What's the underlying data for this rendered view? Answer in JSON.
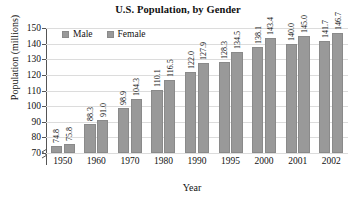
{
  "chart_data": {
    "type": "bar",
    "title": "U.S. Population, by Gender",
    "xlabel": "Year",
    "ylabel": "Population (millions)",
    "categories": [
      "1950",
      "1960",
      "1970",
      "1980",
      "1990",
      "1995",
      "2000",
      "2001",
      "2002"
    ],
    "series": [
      {
        "name": "Male",
        "color": "#999999",
        "values": [
          74.8,
          88.3,
          98.9,
          110.1,
          122.0,
          128.3,
          138.1,
          140.0,
          141.7
        ],
        "labels": [
          "74.8",
          "88.3",
          "98.9",
          "110.1",
          "122.0",
          "128.3",
          "138.1",
          "140.0",
          "141.7"
        ]
      },
      {
        "name": "Female",
        "color": "#999999",
        "values": [
          75.8,
          91.0,
          104.3,
          116.5,
          127.9,
          134.5,
          143.4,
          145.0,
          146.7
        ],
        "labels": [
          "75.8",
          "91.0",
          "104.3",
          "116.5",
          "127.9",
          "134.5",
          "143.4",
          "145.0",
          "146.7"
        ]
      }
    ],
    "ylim": [
      70,
      150
    ],
    "ytick_values": [
      70,
      80,
      90,
      100,
      110,
      120,
      130,
      140,
      150
    ],
    "ytick_labels": [
      "70",
      "80",
      "90",
      "100",
      "110",
      "120",
      "130",
      "140",
      "150"
    ],
    "grid": true,
    "y_axis_break": true,
    "legend_position": "top-left-inside",
    "legend": [
      "Male",
      "Female"
    ]
  }
}
